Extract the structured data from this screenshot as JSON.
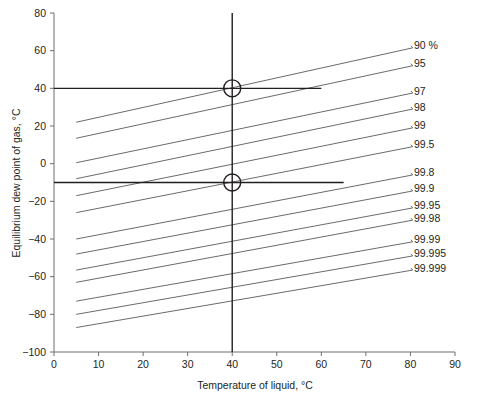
{
  "chart_data": {
    "type": "line",
    "title": "",
    "xlabel": "Temperature of liquid, °C",
    "ylabel": "Equilibrium dew point of gas, °C",
    "xlim": [
      0,
      90
    ],
    "ylim": [
      -100,
      80
    ],
    "xticks": [
      0,
      10,
      20,
      30,
      40,
      50,
      60,
      70,
      80,
      90
    ],
    "yticks": [
      80,
      60,
      40,
      20,
      0,
      -20,
      -40,
      -60,
      -80,
      -100
    ],
    "xtick_labels": [
      "0",
      "10",
      "20",
      "30",
      "40",
      "50",
      "60",
      "70",
      "80",
      "90"
    ],
    "ytick_labels": [
      "80",
      "60",
      "40",
      "20",
      "0",
      "−20",
      "−40",
      "−60",
      "−80",
      "−100"
    ],
    "grid": false,
    "legend_position": "right-inline-labels",
    "series": [
      {
        "name": "90 %",
        "label": "90 %",
        "x": [
          5,
          80.5
        ],
        "y": [
          22.0,
          61.5
        ]
      },
      {
        "name": "95",
        "label": "95",
        "x": [
          5,
          80.5
        ],
        "y": [
          13.5,
          52.0
        ]
      },
      {
        "name": "97",
        "label": "97",
        "x": [
          5,
          80.5
        ],
        "y": [
          0.5,
          37.5
        ]
      },
      {
        "name": "98",
        "label": "98",
        "x": [
          5,
          80.5
        ],
        "y": [
          -8.0,
          29.0
        ]
      },
      {
        "name": "99",
        "label": "99",
        "x": [
          5,
          80.5
        ],
        "y": [
          -17.0,
          19.0
        ]
      },
      {
        "name": "99.5",
        "label": "99.5",
        "x": [
          5,
          80.5
        ],
        "y": [
          -26.0,
          9.0
        ]
      },
      {
        "name": "99.8",
        "label": "99.8",
        "x": [
          5,
          80.5
        ],
        "y": [
          -40.0,
          -6.0
        ]
      },
      {
        "name": "99.9",
        "label": "99.9",
        "x": [
          5,
          80.5
        ],
        "y": [
          -48.0,
          -14.5
        ]
      },
      {
        "name": "99.95",
        "label": "99.95",
        "x": [
          5,
          80.5
        ],
        "y": [
          -56.5,
          -23.5
        ]
      },
      {
        "name": "99.98",
        "label": "99.98",
        "x": [
          5,
          80.5
        ],
        "y": [
          -63.0,
          -30.0
        ]
      },
      {
        "name": "99.99",
        "label": "99.99",
        "x": [
          5,
          80.5
        ],
        "y": [
          -73.0,
          -41.5
        ]
      },
      {
        "name": "99.995",
        "label": "99.995",
        "x": [
          5,
          80.5
        ],
        "y": [
          -80.0,
          -49.0
        ]
      },
      {
        "name": "99.999",
        "label": "99.999",
        "x": [
          5,
          80.5
        ],
        "y": [
          -87.0,
          -56.5
        ]
      }
    ],
    "annotations": {
      "markers": [
        {
          "name": "upper-operating-point",
          "x": 40,
          "y": 40
        },
        {
          "name": "lower-operating-point",
          "x": 40,
          "y": -10
        }
      ],
      "guides": [
        {
          "name": "upper-horizontal-guide",
          "x": [
            0,
            60
          ],
          "y": [
            40,
            40
          ]
        },
        {
          "name": "lower-horizontal-guide",
          "x": [
            0,
            65
          ],
          "y": [
            -10,
            -10
          ]
        },
        {
          "name": "vertical-guide",
          "x": [
            40,
            40
          ],
          "y": [
            80,
            -100
          ]
        }
      ]
    }
  }
}
